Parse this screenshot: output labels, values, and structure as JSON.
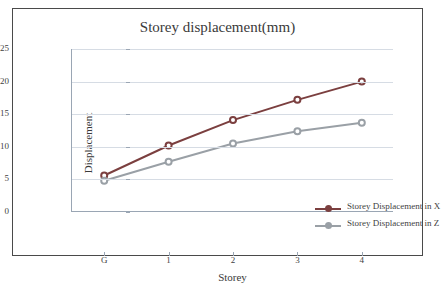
{
  "chart_data": {
    "type": "line",
    "title": "Storey displacement(mm)",
    "xlabel": "Storey",
    "ylabel": "Displacement",
    "categories": [
      "G",
      "1",
      "2",
      "3",
      "4"
    ],
    "ylim": [
      0,
      25
    ],
    "yticks": [
      0,
      5,
      10,
      15,
      20,
      25
    ],
    "grid": true,
    "legend_position": "inside-right",
    "series": [
      {
        "name": "Storey Displacement in X",
        "color": "#7b3f3f",
        "values": [
          5.6,
          10.2,
          14.1,
          17.2,
          20.0
        ]
      },
      {
        "name": "Storey Displacement in Z",
        "color": "#9aa0a6",
        "values": [
          4.8,
          7.7,
          10.5,
          12.4,
          13.7
        ]
      }
    ]
  },
  "colors": {
    "frame": "#4a4a4a",
    "grid": "#d6dce4",
    "axis": "#9aa6b4",
    "text": "#3f3f3f"
  }
}
